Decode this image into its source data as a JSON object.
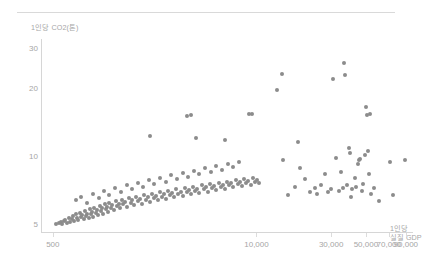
{
  "chart_data": {
    "type": "scatter",
    "title": "",
    "xlabel": "1인당\n실질 GDP",
    "xlabel_lines": [
      "1인당",
      "실질 GDP"
    ],
    "ylabel": "1인당 CO2(톤)",
    "xscale": "log",
    "yscale": "log",
    "xlim": [
      420,
      100000
    ],
    "ylim": [
      4.6,
      33
    ],
    "grid": false,
    "legend": null,
    "xticks": [
      500,
      10000,
      30000,
      50000,
      70000,
      90000
    ],
    "xticklabels": [
      "500",
      "10,000",
      "30,000",
      "50,000",
      "70,000",
      "90,000"
    ],
    "yticks": [
      5,
      10,
      20,
      30
    ],
    "yticklabels": [
      "5",
      "10",
      "20",
      "30"
    ],
    "marker_color": "#8c8c8c",
    "marker_size": 4,
    "series": [
      {
        "name": "국가별 1인당 실질 GDP 대비 1인당 CO2 배출량",
        "points": [
          [
            520,
            5.0
          ],
          [
            545,
            5.05
          ],
          [
            560,
            5.1
          ],
          [
            575,
            5.0
          ],
          [
            590,
            5.15
          ],
          [
            600,
            5.2
          ],
          [
            615,
            5.05
          ],
          [
            630,
            5.3
          ],
          [
            645,
            5.1
          ],
          [
            660,
            5.25
          ],
          [
            670,
            5.4
          ],
          [
            685,
            5.15
          ],
          [
            700,
            5.5
          ],
          [
            710,
            5.3
          ],
          [
            725,
            5.2
          ],
          [
            740,
            5.6
          ],
          [
            755,
            5.35
          ],
          [
            770,
            5.45
          ],
          [
            785,
            5.25
          ],
          [
            800,
            5.7
          ],
          [
            815,
            5.4
          ],
          [
            830,
            5.55
          ],
          [
            845,
            5.3
          ],
          [
            860,
            5.8
          ],
          [
            875,
            5.5
          ],
          [
            890,
            5.65
          ],
          [
            905,
            5.35
          ],
          [
            920,
            5.9
          ],
          [
            940,
            5.6
          ],
          [
            960,
            5.75
          ],
          [
            975,
            5.45
          ],
          [
            995,
            6.0
          ],
          [
            1010,
            5.7
          ],
          [
            1030,
            5.85
          ],
          [
            1050,
            5.55
          ],
          [
            1070,
            6.1
          ],
          [
            1090,
            5.8
          ],
          [
            1110,
            5.95
          ],
          [
            1130,
            5.65
          ],
          [
            1150,
            6.2
          ],
          [
            1180,
            5.9
          ],
          [
            1200,
            6.05
          ],
          [
            1230,
            5.75
          ],
          [
            1260,
            6.3
          ],
          [
            1290,
            6.0
          ],
          [
            1320,
            6.15
          ],
          [
            1350,
            5.85
          ],
          [
            1380,
            6.4
          ],
          [
            1410,
            6.1
          ],
          [
            1450,
            6.25
          ],
          [
            1490,
            5.95
          ],
          [
            1530,
            6.5
          ],
          [
            1570,
            6.2
          ],
          [
            1610,
            6.35
          ],
          [
            1650,
            6.05
          ],
          [
            1700,
            6.6
          ],
          [
            1750,
            6.3
          ],
          [
            1800,
            6.45
          ],
          [
            1850,
            6.15
          ],
          [
            1900,
            6.7
          ],
          [
            1960,
            6.4
          ],
          [
            2020,
            6.55
          ],
          [
            2080,
            6.25
          ],
          [
            2140,
            6.8
          ],
          [
            2200,
            6.5
          ],
          [
            2270,
            6.65
          ],
          [
            2340,
            6.35
          ],
          [
            2410,
            6.9
          ],
          [
            2480,
            6.6
          ],
          [
            2560,
            6.75
          ],
          [
            2640,
            6.45
          ],
          [
            2720,
            7.0
          ],
          [
            2800,
            6.7
          ],
          [
            2890,
            6.85
          ],
          [
            2980,
            6.55
          ],
          [
            3070,
            7.1
          ],
          [
            3170,
            6.8
          ],
          [
            3270,
            6.95
          ],
          [
            3370,
            6.65
          ],
          [
            3480,
            7.2
          ],
          [
            3590,
            6.9
          ],
          [
            3700,
            7.05
          ],
          [
            3820,
            6.75
          ],
          [
            3940,
            7.3
          ],
          [
            4060,
            7.0
          ],
          [
            4190,
            7.15
          ],
          [
            4320,
            6.85
          ],
          [
            4460,
            7.4
          ],
          [
            4600,
            7.1
          ],
          [
            4750,
            7.25
          ],
          [
            4900,
            6.95
          ],
          [
            5050,
            7.5
          ],
          [
            5210,
            7.2
          ],
          [
            5380,
            7.35
          ],
          [
            5550,
            7.05
          ],
          [
            5730,
            7.6
          ],
          [
            5910,
            7.3
          ],
          [
            6100,
            7.45
          ],
          [
            6290,
            7.15
          ],
          [
            6490,
            7.7
          ],
          [
            6700,
            7.4
          ],
          [
            6910,
            7.55
          ],
          [
            7130,
            7.25
          ],
          [
            7360,
            7.8
          ],
          [
            7590,
            7.5
          ],
          [
            7830,
            7.65
          ],
          [
            8080,
            7.35
          ],
          [
            8340,
            7.9
          ],
          [
            8600,
            7.6
          ],
          [
            8880,
            7.75
          ],
          [
            9160,
            7.45
          ],
          [
            9450,
            8.0
          ],
          [
            9750,
            7.7
          ],
          [
            10060,
            7.85
          ],
          [
            10380,
            7.55
          ],
          [
            700,
            6.4
          ],
          [
            760,
            6.6
          ],
          [
            830,
            6.2
          ],
          [
            900,
            6.8
          ],
          [
            980,
            6.5
          ],
          [
            1060,
            7.0
          ],
          [
            1150,
            6.7
          ],
          [
            1250,
            7.2
          ],
          [
            1360,
            6.9
          ],
          [
            1480,
            7.4
          ],
          [
            1600,
            7.1
          ],
          [
            1740,
            7.6
          ],
          [
            1890,
            7.3
          ],
          [
            2050,
            7.8
          ],
          [
            2230,
            7.5
          ],
          [
            2420,
            8.0
          ],
          [
            2630,
            7.7
          ],
          [
            2860,
            8.2
          ],
          [
            3100,
            7.9
          ],
          [
            3370,
            8.4
          ],
          [
            3660,
            8.1
          ],
          [
            3980,
            8.6
          ],
          [
            4320,
            8.3
          ],
          [
            4700,
            8.8
          ],
          [
            5100,
            8.5
          ],
          [
            5540,
            9.0
          ],
          [
            6020,
            8.7
          ],
          [
            6540,
            9.2
          ],
          [
            7100,
            8.9
          ],
          [
            7720,
            9.4
          ],
          [
            2100,
            12.3
          ],
          [
            3600,
            15.0
          ],
          [
            3800,
            15.2
          ],
          [
            4100,
            12.0
          ],
          [
            6300,
            11.8
          ],
          [
            9000,
            15.3
          ],
          [
            9400,
            15.4
          ],
          [
            13500,
            19.6
          ],
          [
            14600,
            23.0
          ],
          [
            14700,
            9.6
          ],
          [
            16000,
            6.7
          ],
          [
            17500,
            7.3
          ],
          [
            18500,
            11.5
          ],
          [
            19000,
            8.8
          ],
          [
            20500,
            7.9
          ],
          [
            22000,
            6.9
          ],
          [
            23500,
            7.2
          ],
          [
            24500,
            6.8
          ],
          [
            26000,
            7.4
          ],
          [
            27500,
            8.3
          ],
          [
            28500,
            6.9
          ],
          [
            30000,
            7.1
          ],
          [
            31000,
            22.0
          ],
          [
            32000,
            9.8
          ],
          [
            33500,
            7.0
          ],
          [
            34500,
            8.5
          ],
          [
            35500,
            7.2
          ],
          [
            36000,
            25.8
          ],
          [
            37000,
            22.8
          ],
          [
            38000,
            7.4
          ],
          [
            39000,
            10.9
          ],
          [
            39500,
            10.3
          ],
          [
            40000,
            6.6
          ],
          [
            41000,
            7.1
          ],
          [
            42500,
            8.0
          ],
          [
            43500,
            7.3
          ],
          [
            44500,
            9.2
          ],
          [
            45500,
            9.6
          ],
          [
            46000,
            9.7
          ],
          [
            47000,
            7.0
          ],
          [
            48000,
            7.5
          ],
          [
            49000,
            10.1
          ],
          [
            50000,
            16.4
          ],
          [
            50500,
            15.2
          ],
          [
            51500,
            10.5
          ],
          [
            52000,
            8.3
          ],
          [
            53500,
            15.4
          ],
          [
            54000,
            6.8
          ],
          [
            56000,
            7.2
          ],
          [
            60500,
            6.3
          ],
          [
            71500,
            9.4
          ],
          [
            74500,
            6.7
          ],
          [
            89000,
            9.6
          ]
        ]
      }
    ]
  }
}
